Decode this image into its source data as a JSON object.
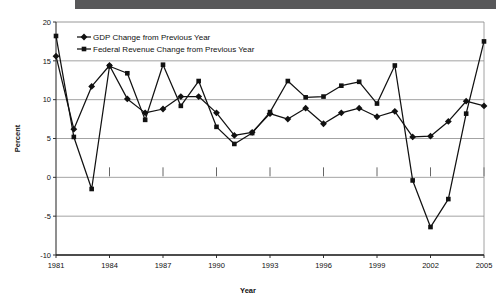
{
  "decor": {
    "top_bar_color": "#58585a"
  },
  "chart_data": {
    "type": "line",
    "title": "",
    "xlabel": "Year",
    "ylabel": "Percent",
    "ylim": [
      -10,
      20
    ],
    "yticks": [
      -10,
      -5,
      0,
      5,
      10,
      15,
      20
    ],
    "ytick_labels": [
      "-10",
      "-5",
      "0",
      "5",
      "10",
      "15",
      "20"
    ],
    "xlim": [
      1981,
      2005
    ],
    "xticks": [
      1981,
      1984,
      1987,
      1990,
      1993,
      1996,
      1999,
      2002,
      2005
    ],
    "xtick_labels": [
      "1981",
      "1984",
      "1987",
      "1990",
      "1993",
      "1996",
      "1999",
      "2002",
      "2005"
    ],
    "grid": "horizontal",
    "legend_position": "top-left-inside",
    "x": [
      1981,
      1982,
      1983,
      1984,
      1985,
      1986,
      1987,
      1988,
      1989,
      1990,
      1991,
      1992,
      1993,
      1994,
      1995,
      1996,
      1997,
      1998,
      1999,
      2000,
      2001,
      2002,
      2003,
      2004,
      2005
    ],
    "series": [
      {
        "name": "GDP Change from Previous Year",
        "marker": "diamond",
        "color": "#111111",
        "values": [
          15.6,
          6.2,
          11.7,
          14.4,
          10.1,
          8.3,
          8.8,
          10.4,
          10.4,
          8.3,
          5.4,
          5.8,
          8.2,
          7.5,
          8.9,
          6.9,
          8.3,
          8.9,
          7.8,
          8.5,
          5.2,
          5.3,
          7.2,
          9.8,
          9.2
        ]
      },
      {
        "name": "Federal Revenue Change from Previous Year",
        "marker": "square",
        "color": "#111111",
        "values": [
          18.2,
          5.2,
          -1.5,
          14.3,
          13.4,
          7.4,
          14.5,
          9.2,
          12.4,
          6.5,
          4.3,
          5.7,
          8.4,
          12.4,
          10.3,
          10.4,
          11.8,
          12.3,
          9.5,
          14.4,
          -0.4,
          -6.4,
          -2.8,
          8.2,
          17.5
        ]
      }
    ]
  }
}
